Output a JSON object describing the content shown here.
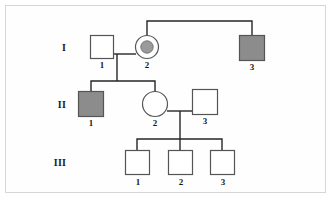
{
  "figure": {
    "kind": "pedigree-chart",
    "border_color": "#d6d6d6",
    "background_color": "#fefefe",
    "line_color": "#262626",
    "affected_fill": "#8c8c8c",
    "carrier_dot_fill": "#9a9a9a",
    "unaffected_fill": "#ffffff",
    "symbol_stroke": "#555555"
  },
  "generations": [
    {
      "label": "I"
    },
    {
      "label": "II"
    },
    {
      "label": "III"
    }
  ],
  "individuals": [
    {
      "id": "I-1",
      "number": "1",
      "sex": "male",
      "status": "unaffected",
      "shape": "square",
      "x": 102,
      "y": 47,
      "size": 23
    },
    {
      "id": "I-2",
      "number": "2",
      "sex": "female",
      "status": "carrier",
      "shape": "circle",
      "x": 147,
      "y": 47,
      "size": 23
    },
    {
      "id": "I-3",
      "number": "3",
      "sex": "male",
      "status": "affected",
      "shape": "square",
      "x": 252,
      "y": 48,
      "size": 25
    },
    {
      "id": "II-1",
      "number": "1",
      "sex": "male",
      "status": "affected",
      "shape": "square",
      "x": 91,
      "y": 104,
      "size": 25
    },
    {
      "id": "II-2",
      "number": "2",
      "sex": "female",
      "status": "unaffected",
      "shape": "circle",
      "x": 155,
      "y": 104,
      "size": 25
    },
    {
      "id": "II-3",
      "number": "3",
      "sex": "male",
      "status": "unaffected",
      "shape": "square",
      "x": 205,
      "y": 102,
      "size": 25
    },
    {
      "id": "III-1",
      "number": "1",
      "sex": "male",
      "status": "unaffected",
      "shape": "square",
      "x": 137,
      "y": 163,
      "size": 24
    },
    {
      "id": "III-2",
      "number": "2",
      "sex": "male",
      "status": "unaffected",
      "shape": "square",
      "x": 180,
      "y": 163,
      "size": 24
    },
    {
      "id": "III-3",
      "number": "3",
      "sex": "male",
      "status": "unaffected",
      "shape": "square",
      "x": 222,
      "y": 163,
      "size": 24
    }
  ],
  "generation_label_positions": [
    {
      "label": "I",
      "x": 62,
      "y": 43
    },
    {
      "label": "II",
      "x": 60,
      "y": 100
    },
    {
      "label": "III",
      "x": 58,
      "y": 158
    }
  ],
  "id_label_positions": [
    {
      "text": "1",
      "x": 92,
      "y": 62
    },
    {
      "text": "2",
      "x": 137,
      "y": 62
    },
    {
      "text": "3",
      "x": 242,
      "y": 65
    },
    {
      "text": "1",
      "x": 81,
      "y": 121
    },
    {
      "text": "2",
      "x": 145,
      "y": 121
    },
    {
      "text": "3",
      "x": 195,
      "y": 119
    },
    {
      "text": "1",
      "x": 127,
      "y": 181
    },
    {
      "text": "2",
      "x": 170,
      "y": 181
    },
    {
      "text": "3",
      "x": 212,
      "y": 181
    }
  ],
  "connections": {
    "sibship_top": {
      "y": 21,
      "x1": 147,
      "x2": 252,
      "drop_left_to": 36,
      "drop_right_to": 36
    },
    "mating_gen1": {
      "y": 54,
      "x1": 113,
      "x2": 136,
      "descent_x": 117,
      "descent_to": 81
    },
    "sibship_gen2": {
      "y": 81,
      "x1": 91,
      "x2": 155,
      "drops_to": 92
    },
    "mating_gen2": {
      "y": 111,
      "x1": 167,
      "x2": 193,
      "descent_x": 180,
      "descent_to": 139
    },
    "sibship_gen3": {
      "y": 139,
      "x1": 137,
      "x2": 222,
      "drops_to": 151
    }
  }
}
